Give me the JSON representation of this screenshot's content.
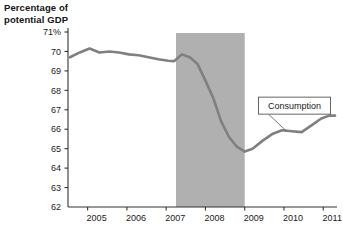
{
  "chart_data": {
    "type": "line",
    "title": "",
    "ylabel": "Percentage of\npotential GDP",
    "xlabel": "",
    "ylim": [
      62,
      71
    ],
    "xlim": [
      2004.5,
      2011.35
    ],
    "grid": false,
    "legend_position": "inline-callout",
    "y_tick_labels": [
      "71%",
      "70",
      "69",
      "68",
      "67",
      "66",
      "65",
      "64",
      "63",
      "62"
    ],
    "y_ticks": [
      71,
      70,
      69,
      68,
      67,
      66,
      65,
      64,
      63,
      62
    ],
    "x_tick_labels": [
      "2005",
      "2006",
      "2007",
      "2008",
      "2009",
      "2010",
      "2011"
    ],
    "x_ticks": [
      2005,
      2006,
      2007,
      2008,
      2009,
      2010,
      2011
    ],
    "series": [
      {
        "name": "Consumption",
        "color": "#808080",
        "x": [
          2004.55,
          2004.8,
          2005.05,
          2005.3,
          2005.55,
          2005.8,
          2006.05,
          2006.3,
          2006.55,
          2006.8,
          2007.05,
          2007.2,
          2007.4,
          2007.6,
          2007.8,
          2008.0,
          2008.2,
          2008.4,
          2008.6,
          2008.8,
          2009.0,
          2009.2,
          2009.45,
          2009.7,
          2009.95,
          2010.2,
          2010.45,
          2010.7,
          2010.95,
          2011.15,
          2011.3
        ],
        "values": [
          69.7,
          69.95,
          70.15,
          69.95,
          70.0,
          69.95,
          69.85,
          69.8,
          69.7,
          69.6,
          69.52,
          69.5,
          69.85,
          69.7,
          69.35,
          68.5,
          67.6,
          66.4,
          65.6,
          65.1,
          64.85,
          65.0,
          65.4,
          65.75,
          65.95,
          65.9,
          65.85,
          66.2,
          66.55,
          66.7,
          66.7
        ]
      }
    ],
    "shaded_regions": [
      {
        "name": "recession-band",
        "label": "",
        "x_start": 2007.25,
        "x_end": 2009.0,
        "color": "#b0b0b0"
      }
    ],
    "annotations": [
      {
        "name": "consumption-callout",
        "text": "Consumption",
        "box_x": 2009.35,
        "box_y": 67.65,
        "point_x": 2010.05,
        "point_y": 65.93
      }
    ]
  },
  "axes": {
    "y_axis_title": "Percentage of\npotential GDP"
  },
  "colors": {
    "line": "#808080",
    "band": "#b0b0b0",
    "axis": "#333333",
    "text": "#1a1a1a",
    "callout_border": "#555555",
    "callout_fill": "#ffffff"
  }
}
